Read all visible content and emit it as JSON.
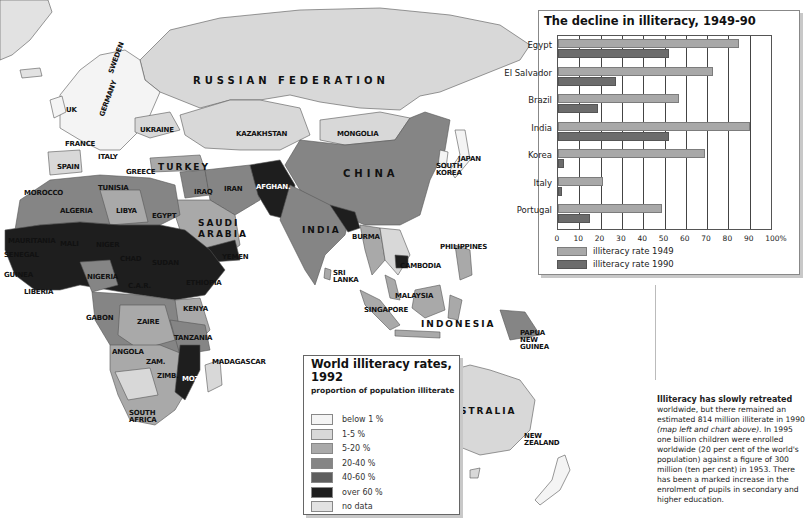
{
  "map": {
    "title": "World illiteracy rates, 1992",
    "legend": {
      "title": "World illiteracy rates, 1992",
      "subtitle": "proportion of population illiterate",
      "items": [
        {
          "label": "below 1 %",
          "color": "#f4f4f4"
        },
        {
          "label": "1-5 %",
          "color": "#d8d8d8"
        },
        {
          "label": "5-20 %",
          "color": "#a9a9a9"
        },
        {
          "label": "20-40 %",
          "color": "#858585"
        },
        {
          "label": "40-60 %",
          "color": "#5e5e5e"
        },
        {
          "label": "over 60 %",
          "color": "#1e1e1e"
        },
        {
          "label": "no data",
          "color": "#e2e2e2"
        }
      ]
    },
    "labels": [
      {
        "text": "RUSSIAN FEDERATION",
        "x": 193,
        "y": 75,
        "style": "big"
      },
      {
        "text": "UK",
        "x": 66,
        "y": 106,
        "style": ""
      },
      {
        "text": "SWEDEN",
        "x": 107,
        "y": 72,
        "style": "rot"
      },
      {
        "text": "GERMANY",
        "x": 98,
        "y": 115,
        "style": "rot"
      },
      {
        "text": "UKRAINE",
        "x": 140,
        "y": 126,
        "style": ""
      },
      {
        "text": "FRANCE",
        "x": 65,
        "y": 140,
        "style": ""
      },
      {
        "text": "ITALY",
        "x": 98,
        "y": 153,
        "style": ""
      },
      {
        "text": "SPAIN",
        "x": 57,
        "y": 163,
        "style": ""
      },
      {
        "text": "GREECE",
        "x": 126,
        "y": 168,
        "style": ""
      },
      {
        "text": "TURKEY",
        "x": 158,
        "y": 162,
        "style": "mid"
      },
      {
        "text": "KAZAKHSTAN",
        "x": 236,
        "y": 130,
        "style": ""
      },
      {
        "text": "MONGOLIA",
        "x": 337,
        "y": 130,
        "style": ""
      },
      {
        "text": "CHINA",
        "x": 343,
        "y": 168,
        "style": "big"
      },
      {
        "text": "JAPAN",
        "x": 458,
        "y": 155,
        "style": ""
      },
      {
        "text": "SOUTH KOREA",
        "x": 436,
        "y": 163,
        "style": "two"
      },
      {
        "text": "MOROCCO",
        "x": 24,
        "y": 189,
        "style": ""
      },
      {
        "text": "TUNISIA",
        "x": 98,
        "y": 184,
        "style": ""
      },
      {
        "text": "ALGERIA",
        "x": 60,
        "y": 207,
        "style": ""
      },
      {
        "text": "LIBYA",
        "x": 116,
        "y": 207,
        "style": ""
      },
      {
        "text": "EGYPT",
        "x": 152,
        "y": 212,
        "style": ""
      },
      {
        "text": "IRAQ",
        "x": 194,
        "y": 188,
        "style": ""
      },
      {
        "text": "IRAN",
        "x": 224,
        "y": 185,
        "style": ""
      },
      {
        "text": "AFGHAN.",
        "x": 256,
        "y": 183,
        "style": "light"
      },
      {
        "text": "SAUDI ARABIA",
        "x": 198,
        "y": 218,
        "style": "two-mid"
      },
      {
        "text": "INDIA",
        "x": 302,
        "y": 225,
        "style": "mid"
      },
      {
        "text": "YEMEN",
        "x": 222,
        "y": 253,
        "style": ""
      },
      {
        "text": "MAURITANIA",
        "x": 8,
        "y": 237,
        "style": ""
      },
      {
        "text": "MALI",
        "x": 60,
        "y": 240,
        "style": ""
      },
      {
        "text": "NIGER",
        "x": 96,
        "y": 241,
        "style": ""
      },
      {
        "text": "CHAD",
        "x": 120,
        "y": 255,
        "style": ""
      },
      {
        "text": "SUDAN",
        "x": 152,
        "y": 259,
        "style": ""
      },
      {
        "text": "SENEGAL",
        "x": 4,
        "y": 251,
        "style": ""
      },
      {
        "text": "GUINEA",
        "x": 4,
        "y": 271,
        "style": ""
      },
      {
        "text": "NIGERIA",
        "x": 87,
        "y": 273,
        "style": ""
      },
      {
        "text": "C.A.R.",
        "x": 128,
        "y": 282,
        "style": ""
      },
      {
        "text": "ETHIOPIA",
        "x": 186,
        "y": 279,
        "style": ""
      },
      {
        "text": "LIBERIA",
        "x": 24,
        "y": 288,
        "style": ""
      },
      {
        "text": "BURMA",
        "x": 352,
        "y": 233,
        "style": ""
      },
      {
        "text": "PHILIPPINES",
        "x": 440,
        "y": 243,
        "style": ""
      },
      {
        "text": "CAMBODIA",
        "x": 400,
        "y": 262,
        "style": ""
      },
      {
        "text": "SRI LANKA",
        "x": 333,
        "y": 270,
        "style": "two"
      },
      {
        "text": "KENYA",
        "x": 183,
        "y": 305,
        "style": ""
      },
      {
        "text": "GABON",
        "x": 86,
        "y": 314,
        "style": ""
      },
      {
        "text": "ZAIRE",
        "x": 137,
        "y": 318,
        "style": ""
      },
      {
        "text": "MALAYSIA",
        "x": 395,
        "y": 292,
        "style": ""
      },
      {
        "text": "SINGAPORE",
        "x": 364,
        "y": 306,
        "style": ""
      },
      {
        "text": "INDONESIA",
        "x": 421,
        "y": 319,
        "style": "mid"
      },
      {
        "text": "PAPUA NEW GUINEA",
        "x": 520,
        "y": 330,
        "style": "two"
      },
      {
        "text": "TANZANIA",
        "x": 174,
        "y": 334,
        "style": ""
      },
      {
        "text": "ANGOLA",
        "x": 112,
        "y": 348,
        "style": ""
      },
      {
        "text": "ZAM.",
        "x": 146,
        "y": 358,
        "style": ""
      },
      {
        "text": "MADAGASCAR",
        "x": 212,
        "y": 358,
        "style": ""
      },
      {
        "text": "ZIMB.",
        "x": 157,
        "y": 372,
        "style": ""
      },
      {
        "text": "MOZ.",
        "x": 182,
        "y": 375,
        "style": "light"
      },
      {
        "text": "SOUTH AFRICA",
        "x": 129,
        "y": 410,
        "style": "two"
      },
      {
        "text": "AUSTRALIA",
        "x": 442,
        "y": 406,
        "style": "mid"
      },
      {
        "text": "NEW ZEALAND",
        "x": 524,
        "y": 433,
        "style": "two"
      }
    ]
  },
  "chart_data": {
    "type": "bar",
    "orientation": "horizontal",
    "title": "The decline in illiteracy, 1949-90",
    "categories": [
      "Egypt",
      "El Salvador",
      "Brazil",
      "India",
      "Korea",
      "Italy",
      "Portugal"
    ],
    "series": [
      {
        "name": "illiteracy rate 1949",
        "color": "#a8a8a8",
        "values": [
          85,
          73,
          57,
          90,
          69,
          21,
          49
        ]
      },
      {
        "name": "illiteracy rate 1990",
        "color": "#6c6c6c",
        "values": [
          52,
          27,
          19,
          52,
          3,
          2,
          15
        ]
      }
    ],
    "xticks": [
      "0",
      "10",
      "20",
      "30",
      "40",
      "50",
      "60",
      "70",
      "80",
      "90",
      "100%"
    ],
    "xlim": [
      0,
      100
    ],
    "xlabel": "",
    "ylabel": "",
    "grid": true,
    "legend_position": "bottom"
  },
  "sidebar_text": {
    "lead": "Illiteracy has slowly retreated",
    "body1": " worldwide, but there remained an estimated 814 million illiterate in 1990 ",
    "italic": "(map left and chart above).",
    "body2": " In 1995 one billion children were enrolled worldwide (20 per cent of the world's population) against a figure of 300 million (ten per cent) in 1953. There has been a marked increase in the enrolment of pupils in secondary and higher education."
  }
}
